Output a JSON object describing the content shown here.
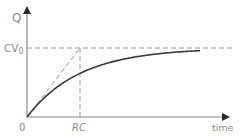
{
  "chart_data": {
    "type": "line",
    "title": "",
    "xlabel": "time",
    "ylabel": "Q",
    "x_ticks": [
      "0",
      "RC"
    ],
    "y_ticks": [
      "CV₀"
    ],
    "grid": false,
    "legend": null,
    "series": [
      {
        "name": "charge",
        "formula": "Q = CV0 (1 - e^(-t/RC))",
        "x": [
          0,
          0.5,
          1,
          1.5,
          2,
          2.5,
          3,
          3.26
        ],
        "values": [
          0,
          0.39,
          0.63,
          0.78,
          0.86,
          0.92,
          0.95,
          0.96
        ]
      }
    ],
    "annotations": [
      {
        "type": "dashed-horizontal",
        "label": "CV₀",
        "y": 1.0
      },
      {
        "type": "dashed-vertical",
        "label": "RC",
        "x": 1.0
      },
      {
        "type": "dashed-tangent",
        "from": [
          0,
          0
        ],
        "to": [
          1,
          1
        ]
      }
    ],
    "xlim": [
      0,
      3.9
    ],
    "ylim": [
      0,
      1.3
    ]
  },
  "labels": {
    "y_axis": "Q",
    "x_axis": "time",
    "origin": "0",
    "rc_prefix": "RC",
    "cv_main": "CV",
    "cv_sub": "0"
  }
}
